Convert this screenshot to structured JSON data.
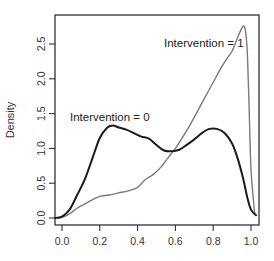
{
  "chart_data": {
    "type": "line",
    "title": "",
    "xlabel": "",
    "ylabel": "Density",
    "xlim": [
      -0.04,
      1.04
    ],
    "ylim": [
      0.0,
      2.85
    ],
    "x_ticks": [
      0.0,
      0.2,
      0.4,
      0.6,
      0.8,
      1.0
    ],
    "x_tick_labels": [
      "0.0",
      "0.2",
      "0.4",
      "0.6",
      "0.8",
      "1.0"
    ],
    "y_ticks": [
      0.0,
      0.5,
      1.0,
      1.5,
      2.0,
      2.5
    ],
    "y_tick_labels": [
      "0.0",
      "0.5",
      "1.0",
      "1.5",
      "2.0",
      "2.5"
    ],
    "grid": false,
    "legend": "none (inline annotations)",
    "series": [
      {
        "name": "Intervention = 0",
        "color": "#1a1a1a",
        "x": [
          -0.04,
          0.0,
          0.04,
          0.08,
          0.12,
          0.16,
          0.2,
          0.24,
          0.27,
          0.3,
          0.34,
          0.38,
          0.42,
          0.46,
          0.5,
          0.54,
          0.58,
          0.62,
          0.66,
          0.7,
          0.74,
          0.78,
          0.82,
          0.86,
          0.9,
          0.93,
          0.96,
          0.98,
          1.0,
          1.03
        ],
        "values": [
          0.0,
          0.02,
          0.12,
          0.33,
          0.55,
          0.85,
          1.15,
          1.3,
          1.33,
          1.3,
          1.27,
          1.22,
          1.17,
          1.14,
          1.05,
          0.97,
          0.96,
          0.98,
          1.05,
          1.13,
          1.22,
          1.28,
          1.28,
          1.22,
          1.07,
          0.85,
          0.55,
          0.3,
          0.12,
          0.03
        ]
      },
      {
        "name": "Intervention = 1",
        "color": "#7a7a7a",
        "x": [
          -0.04,
          0.0,
          0.04,
          0.08,
          0.12,
          0.16,
          0.2,
          0.25,
          0.3,
          0.35,
          0.4,
          0.44,
          0.48,
          0.52,
          0.56,
          0.6,
          0.64,
          0.68,
          0.72,
          0.76,
          0.8,
          0.84,
          0.87,
          0.9,
          0.93,
          0.95,
          0.96,
          0.97,
          0.98,
          0.99,
          1.0,
          1.02
        ],
        "values": [
          0.0,
          0.01,
          0.06,
          0.14,
          0.2,
          0.26,
          0.31,
          0.33,
          0.36,
          0.39,
          0.44,
          0.55,
          0.62,
          0.72,
          0.86,
          1.0,
          1.17,
          1.35,
          1.55,
          1.75,
          1.95,
          2.15,
          2.28,
          2.4,
          2.6,
          2.72,
          2.76,
          2.7,
          2.4,
          1.6,
          0.7,
          0.05
        ]
      }
    ],
    "annotations": [
      {
        "text": "Intervention = 1",
        "x": 0.79,
        "y": 2.55
      },
      {
        "text": "Intervention = 0",
        "x": 0.02,
        "y": 1.42
      }
    ]
  },
  "labels": {
    "ylabel": "Density",
    "annotation_1": "Intervention = 1",
    "annotation_0": "Intervention = 0"
  }
}
